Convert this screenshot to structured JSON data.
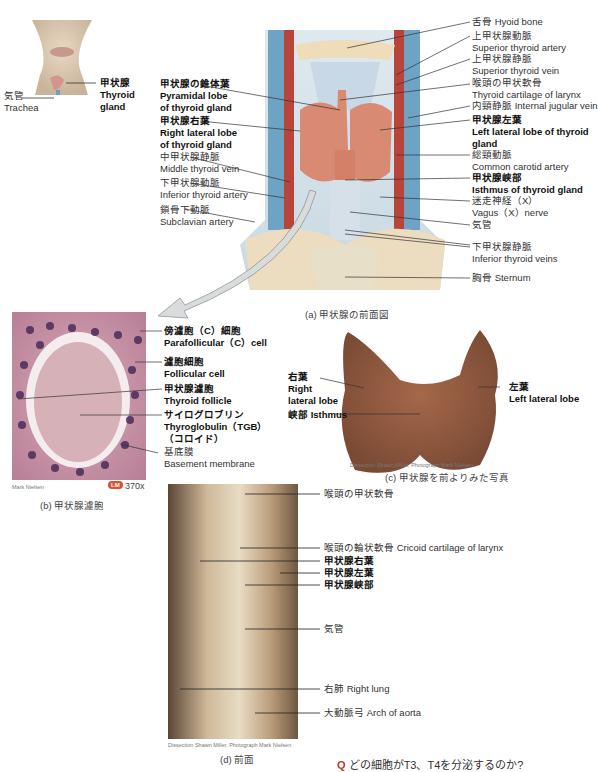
{
  "inset": {
    "trachea": {
      "jp": "気管",
      "en": "Trachea"
    },
    "thyroid": {
      "jp": "甲状腺",
      "en1": "Thyroid",
      "en2": "gland"
    }
  },
  "panel_a": {
    "caption": "(a) 甲状腺の前面図",
    "left_labels": [
      {
        "jp": "甲状腺の錐体葉",
        "en": "Pyramidal lobe",
        "en2": "of thyroid gland",
        "bold": true
      },
      {
        "jp": "甲状腺右葉",
        "en": "Right lateral lobe",
        "en2": "of thyroid gland",
        "bold": true
      },
      {
        "jp": "中甲状腺静脈",
        "en": "Middle thyroid vein",
        "bold": false
      },
      {
        "jp": "下甲状腺動脈",
        "en": "Inferior thyroid artery",
        "bold": false
      },
      {
        "jp": "鎖骨下動脈",
        "en": "Subclavian artery",
        "bold": false
      }
    ],
    "right_labels": [
      {
        "jp": "舌骨 Hyoid bone"
      },
      {
        "jp": "上甲状腺動脈",
        "en": "Superior thyroid artery"
      },
      {
        "jp": "上甲状腺静脈",
        "en": "Superior thyroid vein"
      },
      {
        "jp": "喉頭の甲状軟骨",
        "en": "Thyroid cartilage of larynx"
      },
      {
        "jp": "内頸静脈 Internal jugular vein"
      },
      {
        "jp": "甲状腺左葉",
        "en": "Left lateral lobe of thyroid",
        "en2": "gland",
        "bold": true
      },
      {
        "jp": "総頸動脈",
        "en": "Common carotid artery"
      },
      {
        "jp": "甲状腺峡部",
        "en": "Isthmus of thyroid gland",
        "bold": true
      },
      {
        "jp": "迷走神経（X）",
        "en": "Vagus（X）nerve"
      },
      {
        "jp": "気管"
      },
      {
        "jp": "下甲状腺静脈",
        "en": "Inferior thyroid veins"
      },
      {
        "jp": "胸骨 Sternum"
      }
    ]
  },
  "panel_b": {
    "caption": "(b) 甲状腺濾胞",
    "credit": "Mark Nielsen",
    "badge": "LM",
    "magnification": "370x",
    "badge_color": "#d9522b",
    "labels": [
      {
        "jp": "傍濾胞（C）細胞",
        "en": "Parafollicular（C）cell",
        "bold": true
      },
      {
        "jp": "濾胞細胞",
        "en": "Follicular cell",
        "bold": true
      },
      {
        "jp": "甲状腺濾胞",
        "en": "Thyroid follicle",
        "bold": true
      },
      {
        "jp": "サイログロブリン",
        "en": "Thyroglobulin（TGB）",
        "en2": "（コロイド）",
        "bold": true
      },
      {
        "jp": "基底膜",
        "en": "Basement membrane",
        "bold": false
      }
    ]
  },
  "panel_c": {
    "caption": "(c) 甲状腺を前よりみた写真",
    "credit": "Dissection Shawn Miller, Photograph Mark Nielsen",
    "labels": {
      "right_lobe": {
        "jp": "右葉",
        "en1": "Right",
        "en2": "lateral lobe"
      },
      "isthmus": "峡部 Isthmus",
      "left_lobe": {
        "jp": "左葉",
        "en": "Left lateral lobe"
      }
    }
  },
  "panel_d": {
    "caption": "(d) 前面",
    "credit": "Dissection Shawn Miller, Photograph Mark Nielsen",
    "labels": [
      {
        "text": "喉頭の甲状軟骨",
        "bold": false
      },
      {
        "text": "喉頭の輪状軟骨 Cricoid cartilage of larynx",
        "bold": false
      },
      {
        "text": "甲状腺右葉",
        "bold": true
      },
      {
        "text": "甲状腺左葉",
        "bold": true
      },
      {
        "text": "甲状腺峡部",
        "bold": true
      },
      {
        "text": "気管",
        "bold": false
      },
      {
        "text": "右肺 Right lung",
        "bold": false
      },
      {
        "text": "大動脈弓 Arch of aorta",
        "bold": false
      }
    ]
  },
  "footer": {
    "question_mark": "Q",
    "question": "どの細胞がT3、T4を分泌するのか?"
  }
}
